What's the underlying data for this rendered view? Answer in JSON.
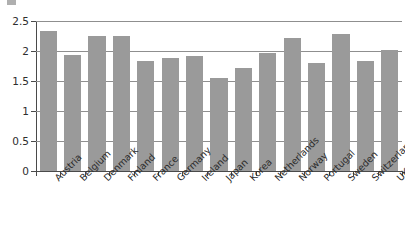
{
  "chart_data": {
    "type": "bar",
    "title": "",
    "subtitle": "",
    "xlabel": "",
    "ylabel": "",
    "ylim": [
      0,
      2.5
    ],
    "ytick_values": [
      0,
      0.5,
      1,
      1.5,
      2,
      2.5
    ],
    "ytick_labels": [
      "0",
      "0.5",
      "1",
      "1.5",
      "2",
      "2.5"
    ],
    "grid": true,
    "legend": false,
    "legend_position": "none",
    "bar_color": "#9a9a9a",
    "axis_color": "#4a4a4a",
    "gridline_color": "#8f8f8f",
    "categories": [
      "Austria",
      "Belgium",
      "Denmark",
      "Finland",
      "France",
      "Germany",
      "Ireland",
      "Japan",
      "Korea",
      "Netherlands",
      "Norway",
      "Portugal",
      "Sweden",
      "Switzerland",
      "UK"
    ],
    "values": [
      2.33,
      1.94,
      2.25,
      2.25,
      1.83,
      1.89,
      1.92,
      1.55,
      1.72,
      1.97,
      2.22,
      1.8,
      2.29,
      1.84,
      2.01
    ]
  }
}
